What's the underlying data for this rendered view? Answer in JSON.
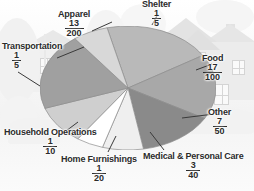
{
  "figure": {
    "background_scene": "suburban-house-photo"
  },
  "chart_data": {
    "type": "pie",
    "title": "",
    "xlabel": "",
    "ylabel": "",
    "legend_position": "callout-labels",
    "grid": false,
    "value_format": "fraction",
    "categories": [
      "Shelter",
      "Food",
      "Other",
      "Medical & Personal Care",
      "Home Furnishings",
      "Household Operations",
      "Transportation",
      "Apparel"
    ],
    "values": [
      0.2,
      0.17,
      0.14,
      0.075,
      0.05,
      0.1,
      0.2,
      0.065
    ],
    "slices": [
      {
        "label": "Shelter",
        "numerator": "1",
        "denominator": "5",
        "fraction": "1/5",
        "value": 0.2,
        "percent": 20,
        "fill": "#b9b9b9"
      },
      {
        "label": "Food",
        "numerator": "17",
        "denominator": "100",
        "fraction": "17/100",
        "value": 0.17,
        "percent": 17,
        "fill": "#a8a8a8"
      },
      {
        "label": "Other",
        "numerator": "7",
        "denominator": "50",
        "fraction": "7/50",
        "value": 0.14,
        "percent": 14,
        "fill": "#8a8a8a"
      },
      {
        "label": "Medical & Personal Care",
        "numerator": "3",
        "denominator": "40",
        "fraction": "3/40",
        "value": 0.075,
        "percent": 7.5,
        "fill": "#efefef"
      },
      {
        "label": "Home Furnishings",
        "numerator": "1",
        "denominator": "20",
        "fraction": "1/20",
        "value": 0.05,
        "percent": 5,
        "fill": "#ffffff"
      },
      {
        "label": "Household Operations",
        "numerator": "1",
        "denominator": "10",
        "fraction": "1/10",
        "value": 0.1,
        "percent": 10,
        "fill": "#cfcfcf"
      },
      {
        "label": "Transportation",
        "numerator": "1",
        "denominator": "5",
        "fraction": "1/5",
        "value": 0.2,
        "percent": 20,
        "fill": "#a0a0a0"
      },
      {
        "label": "Apparel",
        "numerator": "13",
        "denominator": "200",
        "fraction": "13/200",
        "value": 0.065,
        "percent": 6.5,
        "fill": "#d8d8d8"
      }
    ]
  },
  "colors": {
    "text": "#2b2b2b",
    "leader_line": "#3a3a3a",
    "slice_edge": "#8c8c8c",
    "background": "#fdfdfd"
  }
}
